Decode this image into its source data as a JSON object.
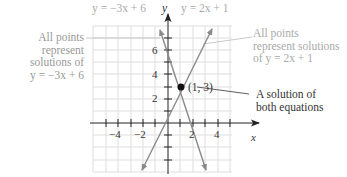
{
  "title_left": "y = −3x + 6",
  "title_right": "y = 2x + 1",
  "axis": {
    "x_label": "x",
    "y_label": "y"
  },
  "y_ticks": [
    {
      "value": 6,
      "label": "6"
    },
    {
      "value": 4,
      "label": "4"
    },
    {
      "value": 2,
      "label": "2"
    }
  ],
  "x_ticks": [
    {
      "value": -4,
      "label": "−4"
    },
    {
      "value": -2,
      "label": "−2"
    },
    {
      "value": 2,
      "label": "2"
    },
    {
      "value": 4,
      "label": "4"
    }
  ],
  "point": {
    "label": "(1, 3)",
    "x": 1,
    "y": 3
  },
  "annotations": {
    "left": [
      "All points",
      "represent",
      "solutions of",
      "y = −3x + 6"
    ],
    "right": [
      "All points",
      "represent solutions",
      "of y = 2x + 1"
    ],
    "solution": [
      "A solution of",
      "both equations"
    ]
  },
  "lines": [
    {
      "equation": "y = -3x + 6",
      "slope": -3,
      "intercept": 6
    },
    {
      "equation": "y = 2x + 1",
      "slope": 2,
      "intercept": 1
    }
  ],
  "colors": {
    "grid": "#d9d9d9",
    "axis": "#333333",
    "line": "#8a8a8a",
    "point": "#111111",
    "faded_text": "#999999"
  }
}
